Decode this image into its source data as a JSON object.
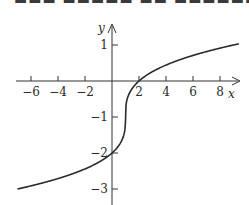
{
  "chart_data": {
    "type": "line",
    "title": "",
    "xlabel": "x",
    "ylabel": "y",
    "xlim": [
      -7.1,
      9.4
    ],
    "ylim": [
      -3.1,
      1.1
    ],
    "x_ticks": [
      -6,
      -4,
      -2,
      2,
      4,
      6,
      8
    ],
    "x_tick_labels": [
      "−6",
      "−4",
      "−2",
      "2",
      "4",
      "6",
      "8"
    ],
    "y_ticks": [
      1,
      -1,
      -2,
      -3
    ],
    "y_tick_labels": [
      "1",
      "−1",
      "−2",
      "−3"
    ],
    "grid": false,
    "series": [
      {
        "name": "curve",
        "description": "cube-root shaped curve through (0,-2), (1,-1), (2,0), (9,1)",
        "x": [
          -7,
          -6,
          -5,
          -4,
          -3,
          -2,
          -1,
          0,
          0.5,
          0.9,
          1,
          1.1,
          1.5,
          2,
          3,
          4,
          5,
          6,
          7,
          8,
          9,
          9.4
        ],
        "y": [
          -3,
          -2.91,
          -2.82,
          -2.71,
          -2.59,
          -2.44,
          -2.26,
          -2,
          -1.79,
          -1.46,
          -1,
          -0.54,
          -0.21,
          0,
          0.26,
          0.44,
          0.59,
          0.71,
          0.82,
          0.91,
          1,
          1.03
        ],
        "color": "#2a2a2a"
      }
    ],
    "axes": {
      "x_axis_arrow": true,
      "y_axis_arrow": true
    }
  },
  "labels": {
    "x_axis": "x",
    "y_axis": "y",
    "x_ticks": [
      "−6",
      "−4",
      "−2",
      "2",
      "4",
      "6",
      "8"
    ],
    "y_ticks": [
      "1",
      "−1",
      "−2",
      "−3"
    ]
  }
}
